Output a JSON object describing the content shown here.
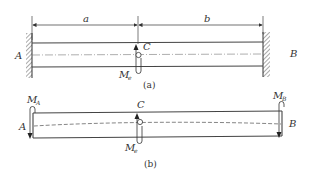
{
  "figure_a": {
    "caption": "(a)",
    "dimension_a": "a",
    "dimension_b": "b",
    "support_left": "A",
    "support_right": "B",
    "point": "C",
    "moment_label": "M",
    "moment_sub": "e"
  },
  "figure_b": {
    "caption": "(b)",
    "support_left": "A",
    "support_right": "B",
    "point": "C",
    "moment_label": "M",
    "moment_sub": "e",
    "moment_a_label": "M",
    "moment_a_sub": "A",
    "moment_b_label": "M",
    "moment_b_sub": "B"
  },
  "colors": {
    "line": "#333333",
    "hatch": "#555555",
    "centerline": "#777777"
  }
}
